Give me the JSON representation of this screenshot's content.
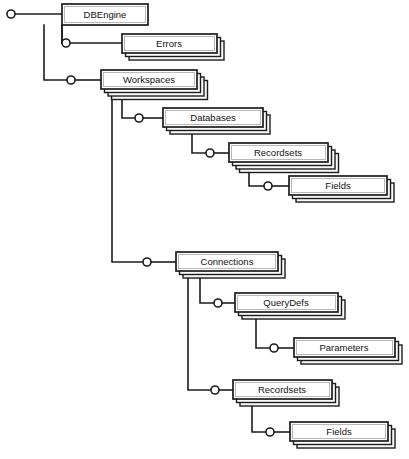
{
  "diagram": {
    "title": "DAO Object Model Hierarchy",
    "type": "tree-hierarchy",
    "canvas": {
      "width": 409,
      "height": 459
    },
    "colors": {
      "background": "#ffffff",
      "line": "#1c1c1c",
      "box_fill": "#ffffff",
      "box_border": "#1c1c1c",
      "box_inner_border": "#b8b8b8",
      "shadow_fill": "#fbfbfb",
      "text": "#111111"
    },
    "root_connector": {
      "x": 11,
      "y": 14,
      "r": 4
    },
    "nodes": [
      {
        "id": "dbengine",
        "label": "DBEngine",
        "collection": false,
        "stack": 1,
        "box": {
          "x": 62,
          "y": 4,
          "w": 86,
          "h": 21
        },
        "label_x": 105,
        "label_y": 15,
        "depth": 0
      },
      {
        "id": "errors",
        "label": "Errors",
        "collection": true,
        "stack": 3,
        "box": {
          "x": 122,
          "y": 34,
          "w": 95,
          "h": 19
        },
        "label_x": 169,
        "label_y": 44,
        "depth": 1,
        "connector": {
          "x": 66,
          "y": 43,
          "r": 4
        }
      },
      {
        "id": "workspaces",
        "label": "Workspaces",
        "collection": true,
        "stack": 4,
        "box": {
          "x": 101,
          "y": 70,
          "w": 96,
          "h": 19
        },
        "label_x": 149,
        "label_y": 80,
        "depth": 1,
        "connector": {
          "x": 71,
          "y": 80,
          "r": 4
        }
      },
      {
        "id": "databases",
        "label": "Databases",
        "collection": true,
        "stack": 3,
        "box": {
          "x": 163,
          "y": 108,
          "w": 100,
          "h": 19
        },
        "label_x": 213,
        "label_y": 118,
        "depth": 2,
        "connector": {
          "x": 139,
          "y": 118,
          "r": 4
        }
      },
      {
        "id": "db-recordsets",
        "label": "Recordsets",
        "collection": true,
        "stack": 4,
        "box": {
          "x": 229,
          "y": 143,
          "w": 99,
          "h": 19
        },
        "label_x": 278,
        "label_y": 153,
        "depth": 3,
        "connector": {
          "x": 210,
          "y": 153,
          "r": 4
        }
      },
      {
        "id": "db-fields",
        "label": "Fields",
        "collection": true,
        "stack": 3,
        "box": {
          "x": 289,
          "y": 176,
          "w": 98,
          "h": 19
        },
        "label_x": 338,
        "label_y": 186,
        "depth": 4,
        "connector": {
          "x": 268,
          "y": 186,
          "r": 4
        }
      },
      {
        "id": "connections",
        "label": "Connections",
        "collection": true,
        "stack": 3,
        "box": {
          "x": 176,
          "y": 252,
          "w": 102,
          "h": 19
        },
        "label_x": 227,
        "label_y": 262,
        "depth": 2,
        "connector": {
          "x": 147,
          "y": 262,
          "r": 4
        }
      },
      {
        "id": "querydefs",
        "label": "QueryDefs",
        "collection": true,
        "stack": 3,
        "box": {
          "x": 235,
          "y": 293,
          "w": 103,
          "h": 19
        },
        "label_x": 286,
        "label_y": 303,
        "depth": 3,
        "connector": {
          "x": 218,
          "y": 303,
          "r": 4
        }
      },
      {
        "id": "parameters",
        "label": "Parameters",
        "collection": true,
        "stack": 3,
        "box": {
          "x": 294,
          "y": 338,
          "w": 101,
          "h": 19
        },
        "label_x": 344,
        "label_y": 348,
        "depth": 4,
        "connector": {
          "x": 274,
          "y": 348,
          "r": 4
        }
      },
      {
        "id": "conn-recordsets",
        "label": "Recordsets",
        "collection": true,
        "stack": 3,
        "box": {
          "x": 233,
          "y": 380,
          "w": 99,
          "h": 19
        },
        "label_x": 282,
        "label_y": 390,
        "depth": 3,
        "connector": {
          "x": 215,
          "y": 390,
          "r": 4
        }
      },
      {
        "id": "conn-fields",
        "label": "Fields",
        "collection": true,
        "stack": 3,
        "box": {
          "x": 290,
          "y": 422,
          "w": 98,
          "h": 19
        },
        "label_x": 339,
        "label_y": 432,
        "depth": 4,
        "connector": {
          "x": 270,
          "y": 432,
          "r": 4
        }
      }
    ],
    "edges": [
      {
        "id": "root-to-dbengine",
        "from": "root",
        "to": "dbengine",
        "path": "M 15 14 L 62 14"
      },
      {
        "id": "dbengine-to-errors",
        "from": "dbengine",
        "to": "errors",
        "path": "M 62 25 L 62 43 L 62 43 M 62 43 L 62 43"
      },
      {
        "id": "dbengine-trunk-errors",
        "from": "dbengine",
        "to": "errors",
        "path": "M 62 25 L 62 43 L 62 43"
      },
      {
        "id": "errors-stub",
        "from": "errors-connector",
        "to": "errors",
        "path": "M 70 43 L 122 43"
      },
      {
        "id": "errors-elbow",
        "from": "dbengine",
        "to": "errors-connector",
        "path": "M 62 25 L 62 43 L 62 43"
      },
      {
        "id": "dbengine-trunk-workspaces",
        "from": "dbengine",
        "to": "workspaces",
        "path": "M 44 25 L 44 80 L 67 80"
      },
      {
        "id": "workspaces-stub",
        "from": "workspaces-connector",
        "to": "workspaces",
        "path": "M 75 80 L 101 80"
      },
      {
        "id": "errors-trunk",
        "from": "dbengine",
        "to": "errors-connector",
        "path": "M 62 25 L 62 43 L 62 43"
      },
      {
        "id": "workspaces-trunk-databases",
        "from": "workspaces",
        "to": "databases",
        "path": "M 122 89 L 122 118 L 135 118"
      },
      {
        "id": "databases-stub",
        "from": "databases-connector",
        "to": "databases",
        "path": "M 143 118 L 163 118"
      },
      {
        "id": "workspaces-trunk-connections",
        "from": "workspaces",
        "to": "connections",
        "path": "M 112 89 L 112 262 L 143 262"
      },
      {
        "id": "connections-stub",
        "from": "connections-connector",
        "to": "connections",
        "path": "M 151 262 L 176 262"
      },
      {
        "id": "databases-trunk-recordsets",
        "from": "databases",
        "to": "db-recordsets",
        "path": "M 192 127 L 192 153 L 206 153"
      },
      {
        "id": "db-recordsets-stub",
        "from": "db-recordsets-connector",
        "to": "db-recordsets",
        "path": "M 214 153 L 229 153"
      },
      {
        "id": "db-recordsets-trunk-fields",
        "from": "db-recordsets",
        "to": "db-fields",
        "path": "M 249 162 L 249 186 L 264 186"
      },
      {
        "id": "db-fields-stub",
        "from": "db-fields-connector",
        "to": "db-fields",
        "path": "M 272 186 L 289 186"
      },
      {
        "id": "connections-trunk-querydefs",
        "from": "connections",
        "to": "querydefs",
        "path": "M 200 271 L 200 303 L 214 303"
      },
      {
        "id": "querydefs-stub",
        "from": "querydefs-connector",
        "to": "querydefs",
        "path": "M 222 303 L 235 303"
      },
      {
        "id": "querydefs-trunk-parameters",
        "from": "querydefs",
        "to": "parameters",
        "path": "M 256 312 L 256 348 L 270 348"
      },
      {
        "id": "parameters-stub",
        "from": "parameters-connector",
        "to": "parameters",
        "path": "M 278 348 L 294 348"
      },
      {
        "id": "connections-trunk-recordsets",
        "from": "connections",
        "to": "conn-recordsets",
        "path": "M 188 271 L 188 390 L 211 390"
      },
      {
        "id": "conn-recordsets-stub",
        "from": "conn-recordsets-connector",
        "to": "conn-recordsets",
        "path": "M 219 390 L 233 390"
      },
      {
        "id": "conn-recordsets-trunk-fields",
        "from": "conn-recordsets",
        "to": "conn-fields",
        "path": "M 252 399 L 252 432 L 266 432"
      },
      {
        "id": "conn-fields-stub",
        "from": "conn-fields-connector",
        "to": "conn-fields",
        "path": "M 274 432 L 290 432"
      }
    ]
  }
}
